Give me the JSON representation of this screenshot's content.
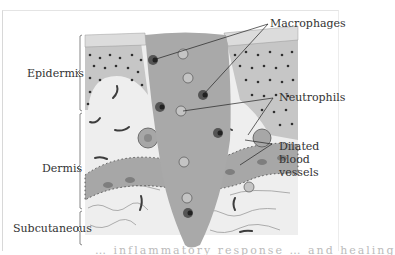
{
  "figure": {
    "layers": [
      {
        "label": "Epidermis"
      },
      {
        "label": "Dermis"
      },
      {
        "label": "Subcutaneous"
      }
    ],
    "callouts": [
      {
        "label": "Macrophages"
      },
      {
        "label": "Neutrophils"
      },
      {
        "label_lines": [
          "Dilated",
          "blood",
          "vessels"
        ]
      }
    ],
    "caption_partial": "… inflammatory response … and healing"
  },
  "colors": {
    "wound": "#a9a9a9",
    "epidermis": "#c8c8c8",
    "dermis": "#eeeeee",
    "vessel": "#9f9f9f",
    "ink": "#333333"
  }
}
